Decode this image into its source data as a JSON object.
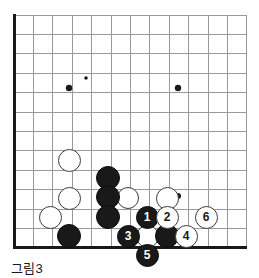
{
  "figure": {
    "caption": "그림3",
    "kind": "go-board-diagram"
  },
  "board": {
    "left": 14,
    "top": 15,
    "spacing": 19.4,
    "cols": 12,
    "rows": 12,
    "edges": {
      "left_is_board_edge": true,
      "bottom_is_board_edge": true,
      "top_is_board_edge": false,
      "right_is_board_edge": false
    },
    "line_color": "#9a9a9a",
    "edge_color": "#1a1a1a",
    "background": "#ffffff",
    "star_points": [
      {
        "cx": 69,
        "cy": 88,
        "r": 3.2
      },
      {
        "cx": 178,
        "cy": 88,
        "r": 3.2
      },
      {
        "cx": 178,
        "cy": 196,
        "r": 3.0
      },
      {
        "cx": 86,
        "cy": 78,
        "r": 1.8
      }
    ]
  },
  "stones": [
    {
      "id": "w-a",
      "color": "white",
      "cx": 69,
      "cy": 160,
      "r": 11.5,
      "label": ""
    },
    {
      "id": "w-b",
      "color": "white",
      "cx": 69,
      "cy": 198,
      "r": 11.5,
      "label": ""
    },
    {
      "id": "w-c",
      "color": "white",
      "cx": 50,
      "cy": 217,
      "r": 11.5,
      "label": ""
    },
    {
      "id": "w-d",
      "color": "white",
      "cx": 128,
      "cy": 198,
      "r": 11.0,
      "label": ""
    },
    {
      "id": "w-e",
      "color": "white",
      "cx": 167,
      "cy": 198,
      "r": 11.5,
      "label": ""
    },
    {
      "id": "w-f",
      "color": "white",
      "cx": 147,
      "cy": 236,
      "r": 11.5,
      "label": ""
    },
    {
      "id": "b-a",
      "color": "black",
      "cx": 108,
      "cy": 178,
      "r": 12.0,
      "label": ""
    },
    {
      "id": "b-b",
      "color": "black",
      "cx": 108,
      "cy": 197,
      "r": 12.0,
      "label": ""
    },
    {
      "id": "b-c",
      "color": "black",
      "cx": 108,
      "cy": 217,
      "r": 12.0,
      "label": ""
    },
    {
      "id": "b-d",
      "color": "black",
      "cx": 69,
      "cy": 236,
      "r": 12.0,
      "label": ""
    },
    {
      "id": "b-e",
      "color": "black",
      "cx": 167,
      "cy": 236,
      "r": 12.0,
      "label": ""
    },
    {
      "id": "m1",
      "color": "black",
      "cx": 147,
      "cy": 217,
      "r": 11.5,
      "label": "1"
    },
    {
      "id": "m2",
      "color": "white",
      "cx": 167,
      "cy": 217,
      "r": 11.5,
      "label": "2"
    },
    {
      "id": "m3",
      "color": "black",
      "cx": 128,
      "cy": 236,
      "r": 11.5,
      "label": "3"
    },
    {
      "id": "m4",
      "color": "white",
      "cx": 186,
      "cy": 236,
      "r": 11.5,
      "label": "4"
    },
    {
      "id": "m5",
      "color": "black",
      "cx": 147,
      "cy": 255,
      "r": 11.5,
      "label": "5"
    },
    {
      "id": "m6",
      "color": "white",
      "cx": 206,
      "cy": 217,
      "r": 11.5,
      "label": "6"
    }
  ]
}
